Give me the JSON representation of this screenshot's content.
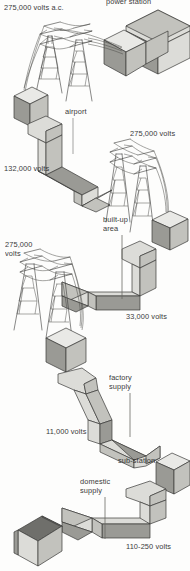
{
  "diagram": {
    "type": "isometric-technical-illustration",
    "palette": {
      "ink": "#2b2b2b",
      "paper": "#fdfdfc",
      "block_top": "#e9e9e6",
      "block_light": "#dcdcd8",
      "block_mid": "#c2c2bd",
      "block_dark": "#9a9a95",
      "block_darkest": "#7c7c78",
      "roof_dark": "#6f6f6b",
      "outline": "#3a3a38",
      "pylon": "#3f3f3d"
    },
    "labels": [
      {
        "id": "power-station",
        "text": "power station",
        "x": 106,
        "y": -2,
        "leader": false
      },
      {
        "id": "hv-ac",
        "text": "275,000 volts a.c.",
        "x": 4,
        "y": 4,
        "leader": false
      },
      {
        "id": "airport",
        "text": "airport",
        "x": 65,
        "y": 108,
        "leader": true,
        "leader_h": 34
      },
      {
        "id": "volts-275-right",
        "text": "275,000 volts",
        "x": 130,
        "y": 130,
        "leader": false
      },
      {
        "id": "volts-132",
        "text": "132,000 volts",
        "x": 4,
        "y": 165,
        "leader": false
      },
      {
        "id": "built-up-area",
        "text": "built-up area",
        "x": 103,
        "y": 216,
        "leader": true,
        "leader_h": 62,
        "multiline": true,
        "width": 30
      },
      {
        "id": "volts-275-left",
        "text": "275,000 volts",
        "x": 5,
        "y": 241,
        "leader": false,
        "multiline": true,
        "width": 34
      },
      {
        "id": "volts-33",
        "text": "33,000 volts",
        "x": 126,
        "y": 313,
        "leader": false
      },
      {
        "id": "factory-supply",
        "text": "factory supply",
        "x": 109,
        "y": 374,
        "leader": true,
        "leader_h": 42,
        "multiline": true,
        "width": 32
      },
      {
        "id": "volts-11",
        "text": "11,000 volts",
        "x": 46,
        "y": 428,
        "leader": false
      },
      {
        "id": "sub-station",
        "text": "sub-station",
        "x": 118,
        "y": 457,
        "leader": false
      },
      {
        "id": "domestic-supply",
        "text": "domestic supply",
        "x": 80,
        "y": 478,
        "leader": true,
        "leader_h": 40,
        "multiline": true,
        "width": 38
      },
      {
        "id": "volts-110-250",
        "text": "110-250 volts",
        "x": 126,
        "y": 543,
        "leader": false
      }
    ],
    "stages": [
      {
        "name": "power-station",
        "voltage": "275,000 volts a.c."
      },
      {
        "name": "transmission",
        "voltage": "275,000 volts"
      },
      {
        "name": "grid-to-airport",
        "voltage": "132,000 volts"
      },
      {
        "name": "built-up-area",
        "voltage": "33,000 volts"
      },
      {
        "name": "factory-supply",
        "voltage": "11,000 volts"
      },
      {
        "name": "domestic-supply",
        "voltage": "110-250 volts"
      }
    ]
  }
}
